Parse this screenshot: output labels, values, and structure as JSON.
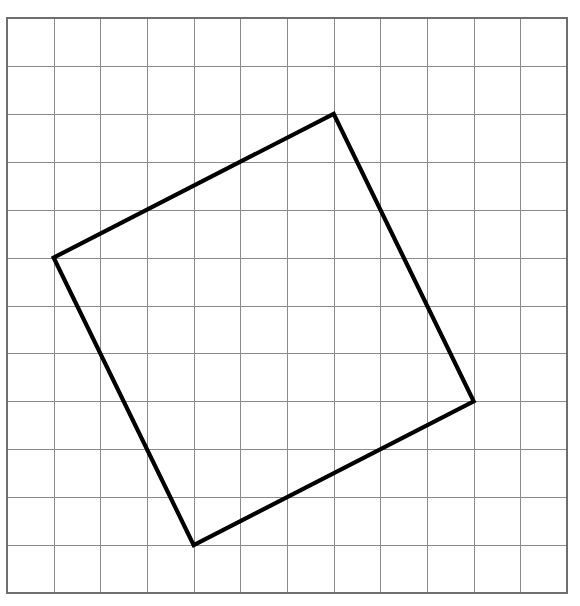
{
  "figure": {
    "background_color": "#ffffff",
    "width": 580,
    "height": 606
  },
  "grid": {
    "name": "square-grid",
    "columns": 12,
    "rows": 12,
    "origin_x": 7,
    "origin_y": 18,
    "cell_width": 46.67,
    "cell_height": 47.92,
    "line_color": "#8a8a8a",
    "line_width": 1.3,
    "border_color": "#6e6e6e",
    "border_width": 1.6
  },
  "chart_data": {
    "type": "scatter",
    "xlabel": "",
    "ylabel": "",
    "grid": true,
    "legend": "none",
    "xlim": [
      0,
      12
    ],
    "ylim": [
      0,
      12
    ],
    "shapes": [
      {
        "name": "tilted-square",
        "type": "polygon",
        "closed": true,
        "stroke": "#000000",
        "stroke_width": 4.2,
        "fill": "none",
        "grid_vertices": [
          [
            1,
            5
          ],
          [
            7,
            2
          ],
          [
            10,
            8
          ],
          [
            4,
            11
          ]
        ],
        "pixel_vertices": [
          [
            58,
            255
          ],
          [
            339,
            114
          ],
          [
            478,
            401
          ],
          [
            194,
            545
          ]
        ],
        "side_vectors": [
          [
            6,
            -3
          ],
          [
            3,
            6
          ],
          [
            -6,
            3
          ],
          [
            -3,
            -6
          ]
        ],
        "side_length_cells": 6.708,
        "area_cells": 45
      }
    ]
  }
}
